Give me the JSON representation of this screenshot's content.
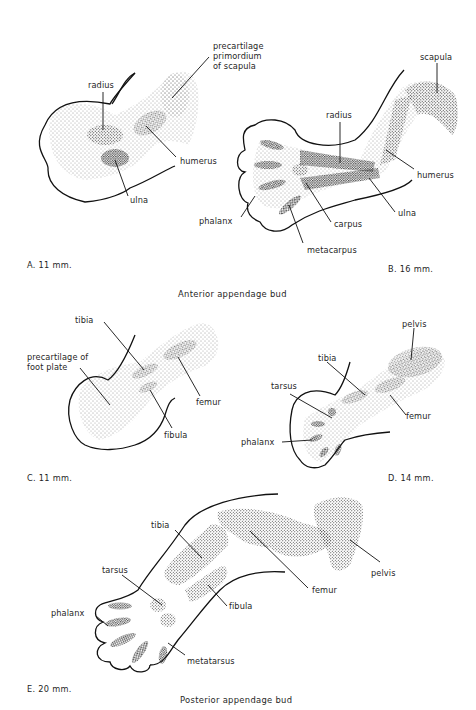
{
  "figure": {
    "panels": [
      {
        "id": "A",
        "caption": "A.  11 mm.",
        "labels": {
          "scapula_primordium": "precartilage\nprimordium\nof scapula",
          "radius": "radius",
          "humerus": "humerus",
          "ulna": "ulna"
        }
      },
      {
        "id": "B",
        "caption": "B.  16 mm.",
        "labels": {
          "scapula": "scapula",
          "radius": "radius",
          "humerus": "humerus",
          "phalanx": "phalanx",
          "carpus": "carpus",
          "ulna": "ulna",
          "metacarpus": "metacarpus"
        }
      },
      {
        "id": "C",
        "caption": "C.  11 mm.",
        "labels": {
          "tibia": "tibia",
          "foot_plate": "precartilage of\nfoot plate",
          "femur": "femur",
          "fibula": "fibula"
        }
      },
      {
        "id": "D",
        "caption": "D.  14 mm.",
        "labels": {
          "pelvis": "pelvis",
          "tibia": "tibia",
          "tarsus": "tarsus",
          "femur": "femur",
          "phalanx": "phalanx"
        }
      },
      {
        "id": "E",
        "caption": "E.  20 mm.",
        "labels": {
          "tibia": "tibia",
          "tarsus": "tarsus",
          "phalanx": "phalanx",
          "femur": "femur",
          "pelvis": "pelvis",
          "fibula": "fibula",
          "metatarsus": "metatarsus"
        }
      }
    ],
    "section_titles": {
      "anterior": "Anterior appendage bud",
      "posterior": "Posterior appendage bud"
    }
  }
}
